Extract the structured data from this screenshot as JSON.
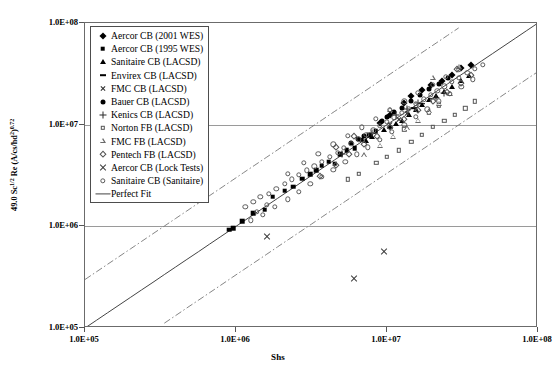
{
  "chart_data": {
    "type": "scatter",
    "title": "",
    "xlabel": "Shs",
    "ylabel": "49.0 Sc^1/2 Re (A/cs/hd^2)^0.72",
    "ylabel_parts": {
      "prefix": "49.0 Sc",
      "sup1": "1/2",
      "mid": " Re (A/cs/hd",
      "sup2": "2",
      "close": ")",
      "sup3": "0.72"
    },
    "xscale": "log",
    "yscale": "log",
    "xlim": [
      100000,
      100000000
    ],
    "ylim": [
      100000,
      100000000
    ],
    "xticks": [
      "1.0E+05",
      "1.0E+06",
      "1.0E+07",
      "1.0E+08"
    ],
    "yticks": [
      "1.0E+05",
      "1.0E+06",
      "1.0E+07",
      "1.0E+08"
    ],
    "xtick_values": [
      100000,
      1000000,
      10000000,
      100000000
    ],
    "ytick_values": [
      100000,
      1000000,
      10000000,
      100000000
    ],
    "grid": {
      "horizontal": true,
      "vertical": false,
      "at": [
        1000000,
        10000000
      ]
    },
    "legend_position": "upper-left-inside",
    "reference_lines": [
      {
        "name": "Perfect Fit",
        "style": "solid",
        "slope": 1,
        "factor": 1.0
      },
      {
        "name": "upper bound",
        "style": "dash-dot",
        "slope": 1,
        "factor": 3.0
      },
      {
        "name": "lower bound",
        "style": "dash-dot",
        "slope": 1,
        "factor": 0.333
      }
    ],
    "series": [
      {
        "name": "Aercor CB (2001 WES)",
        "marker": "diamond",
        "filled": true,
        "points": [
          [
            13000000.0,
            16500000.0
          ],
          [
            14500000.0,
            19000000.0
          ],
          [
            17000000.0,
            22000000.0
          ],
          [
            19500000.0,
            24500000.0
          ],
          [
            23000000.0,
            27000000.0
          ],
          [
            27000000.0,
            31000000.0
          ],
          [
            31000000.0,
            36000000.0
          ],
          [
            36000000.0,
            39000000.0
          ],
          [
            10500000.0,
            12500000.0
          ],
          [
            9000000.0,
            10500000.0
          ]
        ]
      },
      {
        "name": "Aercor CB (1995 WES)",
        "marker": "square",
        "filled": true,
        "points": [
          [
            900000.0,
            930000.0
          ],
          [
            960000.0,
            960000.0
          ],
          [
            1100000.0,
            1120000.0
          ],
          [
            1300000.0,
            1350000.0
          ],
          [
            1550000.0,
            1450000.0
          ],
          [
            1750000.0,
            1950000.0
          ],
          [
            2100000.0,
            2250000.0
          ],
          [
            2400000.0,
            2450000.0
          ],
          [
            2750000.0,
            2950000.0
          ],
          [
            3100000.0,
            3250000.0
          ],
          [
            3400000.0,
            3550000.0
          ],
          [
            3700000.0,
            3950000.0
          ],
          [
            4100000.0,
            4300000.0
          ],
          [
            4500000.0,
            4150000.0
          ],
          [
            4900000.0,
            5100000.0
          ],
          [
            5400000.0,
            5600000.0
          ],
          [
            6100000.0,
            5900000.0
          ],
          [
            6800000.0,
            7100000.0
          ],
          [
            7600000.0,
            7900000.0
          ],
          [
            8400000.0,
            8600000.0
          ]
        ]
      },
      {
        "name": "Sanitaire CB (LACSD)",
        "marker": "triangle",
        "filled": true,
        "points": [
          [
            9500000.0,
            8800000.0
          ],
          [
            10500000.0,
            9600000.0
          ],
          [
            11500000.0,
            10200000.0
          ],
          [
            12500000.0,
            11000000.0
          ],
          [
            14000000.0,
            12500000.0
          ],
          [
            15500000.0,
            14000000.0
          ],
          [
            17000000.0,
            15500000.0
          ],
          [
            19000000.0,
            17500000.0
          ],
          [
            21000000.0,
            19000000.0
          ],
          [
            24000000.0,
            21000000.0
          ],
          [
            27000000.0,
            23500000.0
          ],
          [
            31000000.0,
            27000000.0
          ],
          [
            35000000.0,
            30000000.0
          ],
          [
            8000000.0,
            7500000.0
          ],
          [
            7200000.0,
            6900000.0
          ]
        ]
      },
      {
        "name": "Envirex CB (LACSD)",
        "marker": "dash",
        "filled": true,
        "points": [
          [
            15000000.0,
            14500000.0
          ],
          [
            17000000.0,
            16000000.0
          ],
          [
            19500000.0,
            18000000.0
          ]
        ]
      },
      {
        "name": "FMC CB (LACSD)",
        "marker": "x-small",
        "filled": false,
        "points": [
          [
            10500000.0,
            10000000.0
          ],
          [
            12000000.0,
            11200000.0
          ],
          [
            13500000.0,
            12800000.0
          ],
          [
            15500000.0,
            14500000.0
          ]
        ]
      },
      {
        "name": "Bauer CB (LACSD)",
        "marker": "circle",
        "filled": true,
        "points": [
          [
            5800000.0,
            6600000.0
          ],
          [
            6400000.0,
            7200000.0
          ],
          [
            7000000.0,
            7800000.0
          ],
          [
            10000000.0,
            12000000.0
          ],
          [
            11200000.0,
            13200000.0
          ],
          [
            12500000.0,
            14500000.0
          ],
          [
            14500000.0,
            17000000.0
          ],
          [
            16500000.0,
            19500000.0
          ],
          [
            19000000.0,
            22500000.0
          ],
          [
            22000000.0,
            25000000.0
          ],
          [
            25500000.0,
            28500000.0
          ],
          [
            9200000.0,
            10800000.0
          ]
        ]
      },
      {
        "name": "Kenics CB (LACSD)",
        "marker": "plus",
        "filled": false,
        "points": [
          [
            5000000.0,
            5200000.0
          ],
          [
            8000000.0,
            8300000.0
          ],
          [
            11500000.0,
            12500000.0
          ],
          [
            13500000.0,
            14200000.0
          ],
          [
            16000000.0,
            16200000.0
          ],
          [
            21000000.0,
            18500000.0
          ],
          [
            24000000.0,
            20500000.0
          ]
        ]
      },
      {
        "name": "Norton FB (LACSD)",
        "marker": "square",
        "filled": false,
        "points": [
          [
            8500000.0,
            4200000.0
          ],
          [
            10000000.0,
            4800000.0
          ],
          [
            12000000.0,
            5600000.0
          ],
          [
            14500000.0,
            6800000.0
          ],
          [
            17000000.0,
            8000000.0
          ],
          [
            20000000.0,
            9500000.0
          ],
          [
            24000000.0,
            11000000.0
          ],
          [
            28000000.0,
            12500000.0
          ],
          [
            33000000.0,
            14500000.0
          ],
          [
            6500000.0,
            3300000.0
          ],
          [
            5500000.0,
            2900000.0
          ],
          [
            13000000.0,
            9000000.0
          ],
          [
            19000000.0,
            13000000.0
          ],
          [
            22000000.0,
            15500000.0
          ],
          [
            38000000.0,
            17000000.0
          ]
        ]
      },
      {
        "name": "FMC FB (LACSD)",
        "marker": "triangle",
        "filled": false,
        "points": [
          [
            7000000.0,
            5000000.0
          ],
          [
            9000000.0,
            6200000.0
          ],
          [
            11000000.0,
            7600000.0
          ],
          [
            13500000.0,
            9200000.0
          ],
          [
            16000000.0,
            11000000.0
          ],
          [
            19000000.0,
            13500000.0
          ],
          [
            22000000.0,
            16000000.0
          ],
          [
            26000000.0,
            20000000.0
          ],
          [
            30000000.0,
            37000000.0
          ],
          [
            10500000.0,
            14000000.0
          ],
          [
            20000000.0,
            29000000.0
          ]
        ]
      },
      {
        "name": "Pentech FB (LACSD)",
        "marker": "diamond",
        "filled": false,
        "points": [
          [
            3600000.0,
            3100000.0
          ],
          [
            4600000.0,
            4000000.0
          ],
          [
            5600000.0,
            5200000.0
          ],
          [
            7000000.0,
            6400000.0
          ],
          [
            8600000.0,
            7800000.0
          ],
          [
            10500000.0,
            9500000.0
          ],
          [
            13000000.0,
            11500000.0
          ],
          [
            16000000.0,
            14000000.0
          ],
          [
            20000000.0,
            17000000.0
          ],
          [
            25000000.0,
            21000000.0
          ],
          [
            31000000.0,
            26000000.0
          ],
          [
            36000000.0,
            31000000.0
          ],
          [
            4600000.0,
            6000000.0
          ],
          [
            6000000.0,
            7800000.0
          ],
          [
            29000000.0,
            35000000.0
          ]
        ]
      },
      {
        "name": "Aercor CB (Lock Tests)",
        "marker": "x-large",
        "filled": false,
        "points": [
          [
            1600000.0,
            800000.0
          ],
          [
            6000000.0,
            310000.0
          ],
          [
            9500000.0,
            560000.0
          ]
        ]
      },
      {
        "name": "Sanitaire CB (Sanitaire)",
        "marker": "circle",
        "filled": false,
        "points": [
          [
            1150000.0,
            1550000.0
          ],
          [
            1300000.0,
            1750000.0
          ],
          [
            1450000.0,
            1950000.0
          ],
          [
            1650000.0,
            2100000.0
          ],
          [
            1850000.0,
            2350000.0
          ],
          [
            2100000.0,
            2600000.0
          ],
          [
            2350000.0,
            2900000.0
          ],
          [
            2600000.0,
            3200000.0
          ],
          [
            2950000.0,
            3550000.0
          ],
          [
            3300000.0,
            3900000.0
          ],
          [
            3700000.0,
            4300000.0
          ],
          [
            4200000.0,
            4800000.0
          ],
          [
            4700000.0,
            5300000.0
          ],
          [
            5200000.0,
            5900000.0
          ],
          [
            5800000.0,
            6500000.0
          ],
          [
            6500000.0,
            7200000.0
          ],
          [
            7300000.0,
            8000000.0
          ],
          [
            8100000.0,
            8800000.0
          ],
          [
            9000000.0,
            9700000.0
          ],
          [
            10000000.0,
            10700000.0
          ],
          [
            11200000.0,
            11800000.0
          ],
          [
            12500000.0,
            13000000.0
          ],
          [
            14000000.0,
            14400000.0
          ],
          [
            15500000.0,
            16000000.0
          ],
          [
            17500000.0,
            17800000.0
          ],
          [
            19500000.0,
            19600000.0
          ],
          [
            21500000.0,
            21600000.0
          ],
          [
            24000000.0,
            23800000.0
          ],
          [
            27000000.0,
            26200000.0
          ],
          [
            30000000.0,
            29000000.0
          ],
          [
            34000000.0,
            32500000.0
          ],
          [
            38000000.0,
            35500000.0
          ],
          [
            43000000.0,
            39000000.0
          ],
          [
            2800000.0,
            4200000.0
          ],
          [
            3500000.0,
            5200000.0
          ],
          [
            4400000.0,
            6400000.0
          ],
          [
            5500000.0,
            7800000.0
          ],
          [
            6800000.0,
            9400000.0
          ],
          [
            8400000.0,
            11500000.0
          ],
          [
            10400000.0,
            14000000.0
          ],
          [
            13000000.0,
            17000000.0
          ],
          [
            16000000.0,
            20500000.0
          ],
          [
            20000000.0,
            24500000.0
          ],
          [
            24500000.0,
            29500000.0
          ],
          [
            30000000.0,
            35000000.0
          ],
          [
            1500000.0,
            1300000.0
          ],
          [
            1800000.0,
            1550000.0
          ],
          [
            2200000.0,
            1850000.0
          ],
          [
            2600000.0,
            2200000.0
          ],
          [
            3100000.0,
            2600000.0
          ],
          [
            3700000.0,
            3050000.0
          ],
          [
            4400000.0,
            3600000.0
          ],
          [
            5300000.0,
            4300000.0
          ],
          [
            6300000.0,
            5100000.0
          ],
          [
            7500000.0,
            6000000.0
          ],
          [
            9000000.0,
            7100000.0
          ],
          [
            10800000.0,
            8500000.0
          ],
          [
            13000000.0,
            10000000.0
          ],
          [
            15500000.0,
            12000000.0
          ],
          [
            18500000.0,
            14200000.0
          ],
          [
            22000000.0,
            17000000.0
          ],
          [
            26000000.0,
            20000000.0
          ],
          [
            31000000.0,
            23500000.0
          ],
          [
            37000000.0,
            28000000.0
          ],
          [
            2200000.0,
            3300000.0
          ],
          [
            1250000.0,
            1150000.0
          ],
          [
            1380000.0,
            1380000.0
          ],
          [
            1600000.0,
            1620000.0
          ]
        ]
      }
    ]
  },
  "legend": {
    "items": [
      {
        "label": "Aercor CB (2001 WES)",
        "glyph": "diamond-filled-icon"
      },
      {
        "label": "Aercor CB (1995 WES)",
        "glyph": "square-filled-icon"
      },
      {
        "label": "Sanitaire CB (LACSD)",
        "glyph": "triangle-filled-icon"
      },
      {
        "label": "Envirex CB (LACSD)",
        "glyph": "dash-icon"
      },
      {
        "label": "FMC CB (LACSD)",
        "glyph": "x-small-icon"
      },
      {
        "label": "Bauer CB (LACSD)",
        "glyph": "circle-filled-icon"
      },
      {
        "label": "Kenics CB (LACSD)",
        "glyph": "plus-icon"
      },
      {
        "label": "Norton FB (LACSD)",
        "glyph": "square-open-icon"
      },
      {
        "label": "FMC FB (LACSD)",
        "glyph": "triangle-open-icon"
      },
      {
        "label": "Pentech FB (LACSD)",
        "glyph": "diamond-open-icon"
      },
      {
        "label": "Aercor CB (Lock Tests)",
        "glyph": "x-large-icon"
      },
      {
        "label": "Sanitaire CB (Sanitaire)",
        "glyph": "circle-open-icon"
      },
      {
        "label": "Perfect Fit",
        "glyph": "line-icon"
      }
    ]
  },
  "colors": {
    "frame": "#6b6b6b",
    "gridline": "#9a9a9a",
    "marker": "#000000",
    "fit_line": "#444444",
    "bound_line": "#777777",
    "background": "#ffffff"
  }
}
